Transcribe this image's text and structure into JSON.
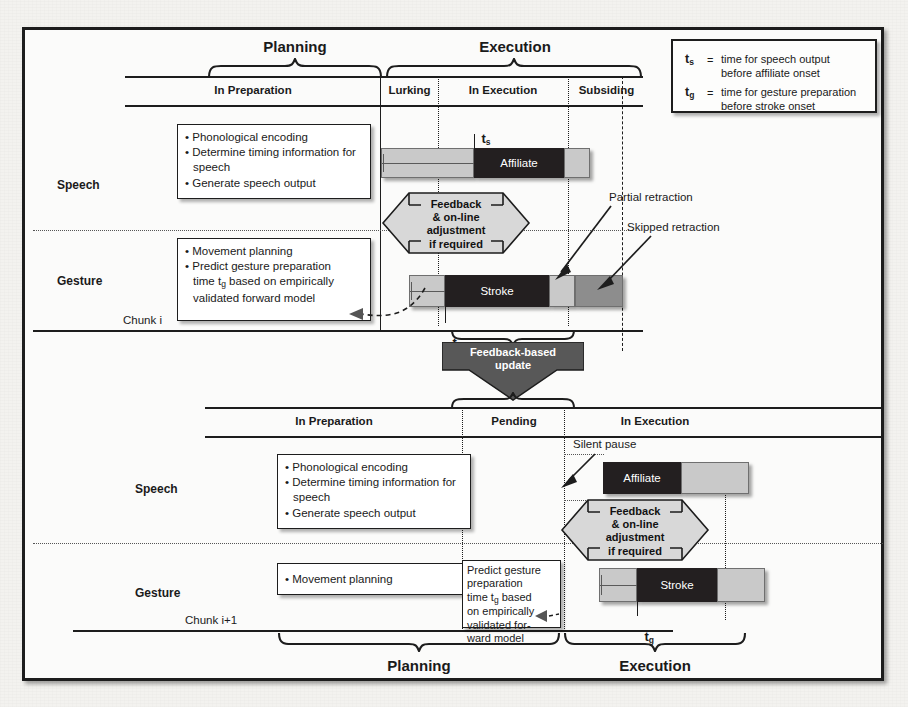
{
  "figure": {
    "title_top_left_brace": "Planning",
    "title_top_right_brace": "Execution",
    "title_bottom_left_brace": "Planning",
    "title_bottom_right_brace": "Execution"
  },
  "legend": {
    "rows": [
      {
        "symbol": "t",
        "sub": "s",
        "eq": "=",
        "line1": "time for speech output",
        "line2": "before affiliate onset"
      },
      {
        "symbol": "t",
        "sub": "g",
        "eq": "=",
        "line1": "time for gesture preparation",
        "line2": "before stroke onset"
      }
    ]
  },
  "chunk_top": {
    "chunk_label": "Chunk i",
    "columns": [
      {
        "name": "In Preparation"
      },
      {
        "name": "Lurking"
      },
      {
        "name": "In Execution"
      },
      {
        "name": "Subsiding"
      }
    ],
    "rows": [
      {
        "label": "Speech"
      },
      {
        "label": "Gesture"
      }
    ],
    "speech_box": {
      "bullets": [
        "Phonological encoding",
        "Determine timing information for speech",
        "Generate speech output"
      ]
    },
    "gesture_box": {
      "bullets": [
        "Movement planning",
        "Predict gesture preparation time tg based on empirically validated forward model"
      ],
      "bullet1": "Movement planning",
      "bullet2_a": "Predict gesture preparation",
      "bullet2_b": "time t",
      "bullet2_sub": "g",
      "bullet2_c": " based on empirically",
      "bullet2_d": "validated forward model"
    },
    "speech_bar": {
      "segments": [
        {
          "label": "",
          "kind": "light"
        },
        {
          "label": "Affiliate",
          "kind": "dark"
        },
        {
          "label": "",
          "kind": "light"
        }
      ]
    },
    "gesture_bar": {
      "segments": [
        {
          "label": "",
          "kind": "light"
        },
        {
          "label": "Stroke",
          "kind": "dark"
        },
        {
          "label": "",
          "kind": "light"
        },
        {
          "label": "",
          "kind": "medium"
        }
      ]
    },
    "markers": {
      "ts": "t",
      "ts_sub": "s",
      "tg": "t",
      "tg_sub": "g"
    },
    "feedback_hex": [
      "Feedback",
      "& on-line",
      "adjustment",
      "if required"
    ],
    "annotations": [
      {
        "name": "partial-retraction",
        "text": "Partial retraction"
      },
      {
        "name": "skipped-retraction",
        "text": "Skipped retraction"
      }
    ]
  },
  "feedback_update_arrow": {
    "line1": "Feedback-based",
    "line2": "update"
  },
  "chunk_bottom": {
    "chunk_label": "Chunk i+1",
    "columns": [
      {
        "name": "In Preparation"
      },
      {
        "name": "Pending"
      },
      {
        "name": "In Execution"
      }
    ],
    "rows": [
      {
        "label": "Speech"
      },
      {
        "label": "Gesture"
      }
    ],
    "speech_box": {
      "bullets": [
        "Phonological encoding",
        "Determine timing information for speech",
        "Generate speech output"
      ]
    },
    "gesture_box": {
      "bullet1": "Movement planning"
    },
    "predict_box": {
      "lines": [
        "Predict gesture",
        "preparation",
        "time tg based",
        "on empirically",
        "validated for-",
        "ward model"
      ],
      "l1": "Predict gesture",
      "l2": "preparation",
      "l3a": "time t",
      "l3sub": "g",
      "l3b": " based",
      "l4": "on empirically",
      "l5": "validated for-",
      "l6": "ward model"
    },
    "speech_bar": {
      "segments": [
        {
          "label": "Affiliate",
          "kind": "dark"
        },
        {
          "label": "",
          "kind": "light"
        }
      ]
    },
    "gesture_bar": {
      "segments": [
        {
          "label": "",
          "kind": "light"
        },
        {
          "label": "Stroke",
          "kind": "dark"
        },
        {
          "label": "",
          "kind": "light"
        }
      ]
    },
    "markers": {
      "tg": "t",
      "tg_sub": "g"
    },
    "feedback_hex": [
      "Feedback",
      "& on-line",
      "adjustment",
      "if required"
    ],
    "annotations": [
      {
        "name": "silent-pause",
        "text": "Silent pause"
      }
    ]
  }
}
